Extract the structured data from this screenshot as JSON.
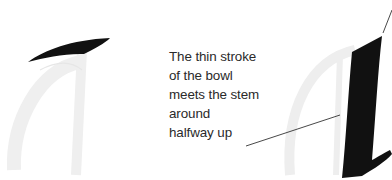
{
  "diagram": {
    "annotation": {
      "lines": [
        "The thin stroke",
        "of the bowl",
        "meets the stem",
        "around",
        "halfway up"
      ]
    },
    "colors": {
      "ink": "#111111",
      "ghost_letter": "#f0f0f0",
      "leader_line": "#333333",
      "text": "#2a2a2a"
    }
  }
}
